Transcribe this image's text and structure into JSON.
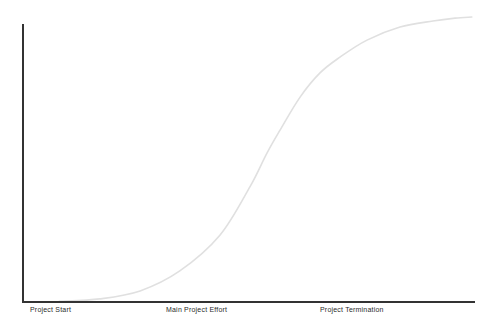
{
  "chart_data": {
    "type": "line",
    "title": "",
    "xlabel": "",
    "ylabel": "",
    "grid": false,
    "legend": false,
    "background_color": "#ffffff",
    "axis_color": "#333333",
    "curve_color": "#e0e0e0",
    "label_color": "#2b2b2b",
    "x_range": [
      0,
      1
    ],
    "y_range": [
      0,
      1
    ],
    "x_tick_labels": [
      "Project Start",
      "Main Project Effort",
      "Project Termination"
    ],
    "x_tick_positions": [
      0.0155,
      0.316,
      0.657
    ],
    "series": [
      {
        "name": "cumulative-project-effort",
        "points": [
          [
            0.08,
            0.002
          ],
          [
            0.17,
            0.011
          ],
          [
            0.259,
            0.039
          ],
          [
            0.347,
            0.109
          ],
          [
            0.436,
            0.235
          ],
          [
            0.502,
            0.404
          ],
          [
            0.54,
            0.523
          ],
          [
            0.569,
            0.604
          ],
          [
            0.613,
            0.719
          ],
          [
            0.657,
            0.804
          ],
          [
            0.702,
            0.86
          ],
          [
            0.761,
            0.919
          ],
          [
            0.834,
            0.965
          ],
          [
            0.907,
            0.986
          ],
          [
            0.956,
            0.996
          ],
          [
            0.993,
            1.0
          ]
        ]
      }
    ]
  }
}
